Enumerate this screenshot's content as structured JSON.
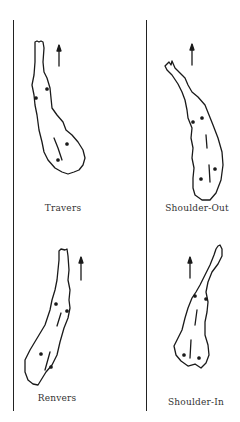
{
  "figure": {
    "panels": [
      {
        "id": "travers",
        "label": "Travers"
      },
      {
        "id": "shoulder-out",
        "label": "Shoulder-Out"
      },
      {
        "id": "renvers",
        "label": "Renvers"
      },
      {
        "id": "shoulder-in",
        "label": "Shoulder-In"
      }
    ],
    "colors": {
      "ink": "#1a1a1a",
      "label": "#333333",
      "background": "#ffffff"
    }
  }
}
